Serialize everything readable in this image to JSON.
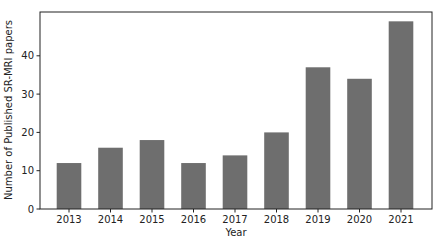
{
  "chart_data": {
    "type": "bar",
    "title": "",
    "xlabel": "Year",
    "ylabel": "Number of Published SR-MRI papers",
    "categories": [
      "2013",
      "2014",
      "2015",
      "2016",
      "2017",
      "2018",
      "2019",
      "2020",
      "2021"
    ],
    "values": [
      12,
      16,
      18,
      12,
      14,
      20,
      37,
      34,
      49
    ],
    "ylim": [
      0,
      51.5
    ],
    "yticks": [
      0,
      10,
      20,
      30,
      40
    ],
    "grid": false,
    "legend": null,
    "bar_color": "#6e6e6e"
  }
}
